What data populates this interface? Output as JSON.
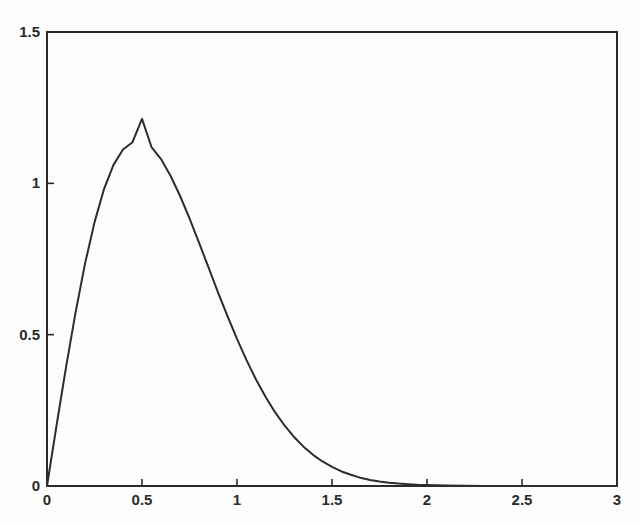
{
  "figure": {
    "background_color": "#fdfdfd",
    "axes_color": "#2a2a2a",
    "line_color": "#2d2d2d"
  },
  "axes": {
    "x_ticks": [
      {
        "value": 0,
        "label": "0"
      },
      {
        "value": 0.5,
        "label": "0.5"
      },
      {
        "value": 1,
        "label": "1"
      },
      {
        "value": 1.5,
        "label": "1.5"
      },
      {
        "value": 2,
        "label": "2"
      },
      {
        "value": 2.5,
        "label": "2.5"
      },
      {
        "value": 3,
        "label": "3"
      }
    ],
    "y_ticks": [
      {
        "value": 0,
        "label": "0"
      },
      {
        "value": 0.5,
        "label": "0.5"
      },
      {
        "value": 1,
        "label": "1"
      },
      {
        "value": 1.5,
        "label": "1.5"
      }
    ]
  },
  "chart_data": {
    "type": "line",
    "title": "",
    "subtitle": "",
    "xlabel": "",
    "ylabel": "",
    "xlim": [
      0,
      3
    ],
    "ylim": [
      0,
      1.5
    ],
    "grid": false,
    "legend": false,
    "legend_position": "none",
    "xticks": [
      0,
      0.5,
      1,
      1.5,
      2,
      2.5,
      3
    ],
    "xticklabels": [
      "0",
      "0.5",
      "1",
      "1.5",
      "2",
      "2.5",
      "3"
    ],
    "yticks": [
      0,
      0.5,
      1,
      1.5
    ],
    "yticklabels": [
      "0",
      "0.5",
      "1",
      "1.5"
    ],
    "annotations": [],
    "series": [
      {
        "name": "Rayleigh pdf (sigma = 0.5)",
        "color": "#2d2d2d",
        "linewidth": 2,
        "x": [
          0,
          0.05,
          0.1,
          0.15,
          0.2,
          0.25,
          0.3,
          0.35,
          0.4,
          0.45,
          0.5,
          0.55,
          0.6,
          0.65,
          0.7,
          0.75,
          0.8,
          0.85,
          0.9,
          0.95,
          1.0,
          1.05,
          1.1,
          1.15,
          1.2,
          1.25,
          1.3,
          1.35,
          1.4,
          1.45,
          1.5,
          1.55,
          1.6,
          1.65,
          1.7,
          1.75,
          1.8,
          1.85,
          1.9,
          1.95,
          2.0,
          2.1,
          2.2,
          2.3,
          2.4,
          2.5,
          2.6,
          2.7,
          2.8,
          2.9,
          3.0
        ],
        "y": [
          0.0,
          0.199,
          0.392,
          0.572,
          0.734,
          0.871,
          0.981,
          1.061,
          1.112,
          1.136,
          1.213,
          1.12,
          1.08,
          1.025,
          0.959,
          0.884,
          0.804,
          0.722,
          0.64,
          0.561,
          0.486,
          0.416,
          0.352,
          0.295,
          0.244,
          0.2,
          0.162,
          0.13,
          0.103,
          0.081,
          0.063,
          0.048,
          0.037,
          0.027,
          0.02,
          0.015,
          0.011,
          0.008,
          0.006,
          0.004,
          0.003,
          0.0015,
          0.0007,
          0.0003,
          0.00015,
          6e-05,
          3e-05,
          1e-05,
          4e-06,
          2e-06,
          1e-06
        ]
      }
    ]
  }
}
